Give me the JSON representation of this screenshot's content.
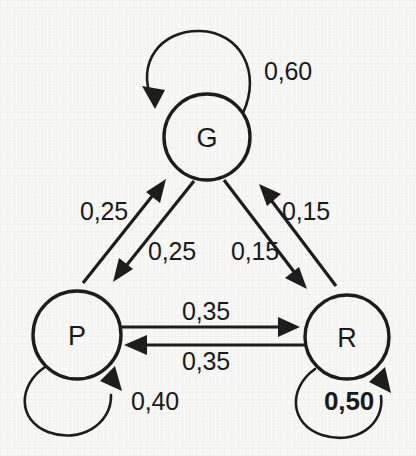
{
  "diagram": {
    "type": "markov-chain-state-diagram",
    "colors": {
      "background": "#f7f7f6",
      "stroke": "#1d1d1d",
      "text": "#1a1a1a"
    },
    "nodes": [
      {
        "id": "G",
        "label": "G",
        "cx": 207,
        "cy": 137,
        "r": 43
      },
      {
        "id": "P",
        "label": "P",
        "cx": 77,
        "cy": 335,
        "r": 44
      },
      {
        "id": "R",
        "label": "R",
        "cx": 347,
        "cy": 337,
        "r": 42
      }
    ],
    "edges": [
      {
        "from": "G",
        "to": "G",
        "weight": "0,60",
        "kind": "self-loop",
        "label_x": 288,
        "label_y": 71,
        "bold": false
      },
      {
        "from": "P",
        "to": "P",
        "weight": "0,40",
        "kind": "self-loop",
        "label_x": 155,
        "label_y": 401,
        "bold": false
      },
      {
        "from": "R",
        "to": "R",
        "weight": "0,50",
        "kind": "self-loop",
        "label_x": 349,
        "label_y": 401,
        "bold": true
      },
      {
        "from": "P",
        "to": "G",
        "weight": "0,25",
        "kind": "straight",
        "label_x": 104,
        "label_y": 211,
        "bold": false
      },
      {
        "from": "G",
        "to": "P",
        "weight": "0,25",
        "kind": "straight",
        "label_x": 172,
        "label_y": 251,
        "bold": false
      },
      {
        "from": "G",
        "to": "R",
        "weight": "0,15",
        "kind": "straight",
        "label_x": 255,
        "label_y": 251,
        "bold": false
      },
      {
        "from": "R",
        "to": "G",
        "weight": "0,15",
        "kind": "straight",
        "label_x": 306,
        "label_y": 211,
        "bold": false
      },
      {
        "from": "P",
        "to": "R",
        "weight": "0,35",
        "kind": "straight",
        "label_x": 206,
        "label_y": 311,
        "bold": false
      },
      {
        "from": "R",
        "to": "P",
        "weight": "0,35",
        "kind": "straight",
        "label_x": 206,
        "label_y": 361,
        "bold": false
      }
    ]
  }
}
